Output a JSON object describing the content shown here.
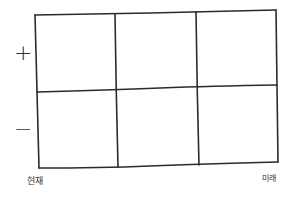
{
  "diagram": {
    "type": "hand-drawn grid",
    "rows": 2,
    "columns": 3,
    "row_labels": [
      "+",
      "−"
    ],
    "axis_labels": {
      "start": "현재",
      "end": "미래"
    },
    "line_color": "#2b2b2b",
    "background": "#ffffff"
  }
}
